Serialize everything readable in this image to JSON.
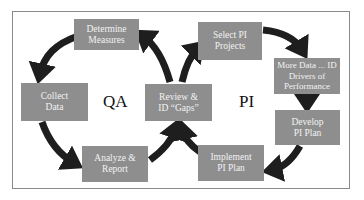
{
  "diagram": {
    "colors": {
      "box_fill": "#8e8e8e",
      "box_text": "#f2f2f2",
      "arrow": "#1e1e1e",
      "frame_border": "#8a8a8a"
    },
    "cycle_labels": {
      "qa": "QA",
      "pi": "PI"
    },
    "qa_cycle": {
      "determine_measures": "Determine Measures",
      "collect_data": "Collect Data",
      "analyze_report": "Analyze & Report",
      "review_gaps": "Review & ID “Gaps”"
    },
    "pi_cycle": {
      "select_projects": "Select PI Projects",
      "more_data": "More Data ... ID Drivers of Performance",
      "develop_plan": "Develop PI Plan",
      "implement_plan": "Implement PI Plan"
    }
  }
}
